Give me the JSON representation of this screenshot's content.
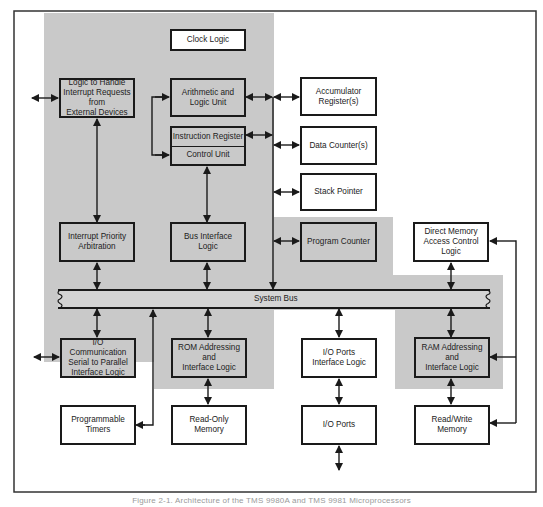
{
  "figure": {
    "caption": "Figure 2-1. Architecture of the TMS 9980A and TMS 9981 Microprocessors",
    "colors": {
      "shade": "#c9c9c9",
      "line": "#1a1a1a",
      "background": "#ffffff"
    }
  },
  "blocks": {
    "clock_logic": "Clock Logic",
    "interrupt_logic": "Logic to Handle\nInterrupt Requests\nfrom\nExternal Devices",
    "alu": "Arithmetic and\nLogic Unit",
    "instruction_register": "Instruction Register",
    "control_unit": "Control Unit",
    "accumulator": "Accumulator\nRegister(s)",
    "data_counters": "Data Counter(s)",
    "stack_pointer": "Stack Pointer",
    "interrupt_priority": "Interrupt Priority\nArbitration",
    "bus_interface": "Bus Interface\nLogic",
    "program_counter": "Program Counter",
    "dma": "Direct Memory\nAccess Control\nLogic",
    "system_bus": "System Bus",
    "io_comm": "I/O Communication\nSerial to Parallel\nInterface Logic",
    "rom_addressing": "ROM Addressing\nand\nInterface Logic",
    "io_ports_interface": "I/O Ports\nInterface Logic",
    "ram_addressing": "RAM Addressing\nand\nInterface Logic",
    "timers": "Programmable\nTimers",
    "rom": "Read-Only\nMemory",
    "io_ports": "I/O Ports",
    "ram": "Read/Write\nMemory"
  }
}
